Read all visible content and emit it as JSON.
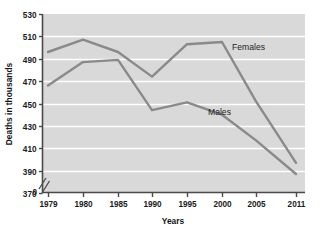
{
  "chart_data": {
    "type": "line",
    "title": "",
    "xlabel": "Years",
    "ylabel": "Deaths in thousands",
    "x": [
      1979,
      1980,
      1985,
      1990,
      1995,
      2000,
      2005,
      2011
    ],
    "categories": [
      "1979",
      "1980",
      "1985",
      "1990",
      "1995",
      "2000",
      "2005",
      "2011"
    ],
    "xtick_labels": [
      "1979",
      "1980",
      "1985",
      "1990",
      "1995",
      "2000",
      "2005",
      "2011"
    ],
    "ytick_labels": [
      "370",
      "390",
      "410",
      "430",
      "450",
      "470",
      "490",
      "510",
      "530"
    ],
    "ytick_values": [
      370,
      390,
      410,
      430,
      450,
      470,
      490,
      510,
      530
    ],
    "ylim": [
      370,
      530
    ],
    "xlim": [
      1979,
      2011
    ],
    "grid": true,
    "axis_break": true,
    "axis_break_label": "0",
    "legend_position": "inline-right",
    "series": [
      {
        "name": "Females",
        "label": "Females",
        "values": [
          496,
          507,
          496,
          474,
          503,
          505,
          452,
          397
        ],
        "color": "#8a8a8a"
      },
      {
        "name": "Males",
        "label": "Males",
        "values": [
          466,
          487,
          489,
          444,
          451,
          440,
          417,
          387
        ],
        "color": "#8a8a8a"
      }
    ],
    "colors": {
      "plot_background": "#d9d9d9",
      "gridline": "#ffffff",
      "axis": "#4a4a4a",
      "line": "#8a8a8a",
      "text": "#1b1b1b",
      "page_background": "#ffffff"
    }
  }
}
